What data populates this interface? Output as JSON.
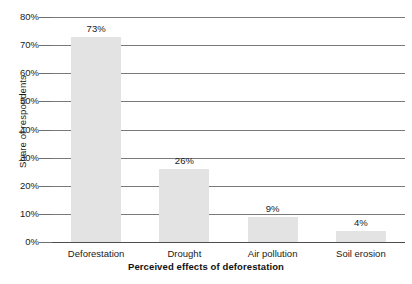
{
  "chart_data": {
    "type": "bar",
    "title": "",
    "xlabel": "Perceived effects of deforestation",
    "ylabel": "Share of respondents",
    "categories": [
      "Deforestation",
      "Drought",
      "Air pollution",
      "Soil erosion"
    ],
    "values": [
      73,
      26,
      9,
      4
    ],
    "value_labels": [
      "73%",
      "26%",
      "9%",
      "4%"
    ],
    "ylim": [
      0,
      80
    ],
    "ytick_values": [
      0,
      10,
      20,
      30,
      40,
      50,
      60,
      70,
      80
    ],
    "ytick_labels": [
      "0%",
      "10%",
      "20%",
      "30%",
      "40%",
      "50%",
      "60%",
      "70%",
      "80%"
    ],
    "grid": true,
    "grid_axis": "y",
    "legend": false,
    "bar_color": "#e3e3e3",
    "gridline_color": "#7a7a7a",
    "axis_color": "#4d4d4d",
    "text_color": "#1a1a1a",
    "background": "#ffffff"
  }
}
